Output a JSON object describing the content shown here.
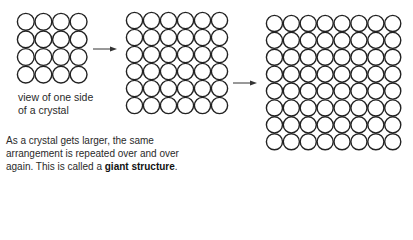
{
  "diagram": {
    "grids": [
      {
        "name": "small-crystal",
        "rows": 4,
        "cols": 4,
        "x": 16,
        "y": 12,
        "cell": 17.6
      },
      {
        "name": "medium-crystal",
        "rows": 6,
        "cols": 6,
        "x": 125,
        "y": 11,
        "cell": 17.0
      },
      {
        "name": "large-crystal",
        "rows": 8,
        "cols": 8,
        "x": 265,
        "y": 14,
        "cell": 16.9
      }
    ],
    "arrows": [
      {
        "name": "arrow-1",
        "x1": 93,
        "y1": 49,
        "x2": 117,
        "y2": 49
      },
      {
        "name": "arrow-2",
        "x1": 233,
        "y1": 83,
        "x2": 257,
        "y2": 83
      }
    ],
    "stroke_color": "#222222"
  },
  "caption": {
    "line1": "view of one side",
    "line2": "of a crystal"
  },
  "paragraph": {
    "line1": "As a crystal gets larger, the same",
    "line2": "arrangement is repeated over and over",
    "line3_prefix": "again. This is called a ",
    "line3_bold": "giant structure",
    "line3_suffix": "."
  }
}
